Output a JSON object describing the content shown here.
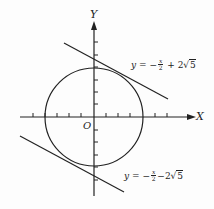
{
  "diagram": {
    "axes": {
      "x_label": "X",
      "y_label": "Y",
      "origin_label": "O"
    },
    "circle": {
      "center": [
        0,
        0
      ],
      "radius_ticks": 4
    },
    "tangent_upper": {
      "lhs": "y",
      "eq": "=",
      "minus": "−",
      "num": "x",
      "den": "2",
      "plus": "+",
      "coef": "2",
      "root": "5"
    },
    "tangent_lower": {
      "lhs": "y",
      "eq": "=",
      "minus": "−",
      "num": "x",
      "den": "2",
      "minus2": "−",
      "coef": "2",
      "root": "5"
    },
    "colors": {
      "stroke": "#222222",
      "background": "#fdfdfd"
    }
  }
}
